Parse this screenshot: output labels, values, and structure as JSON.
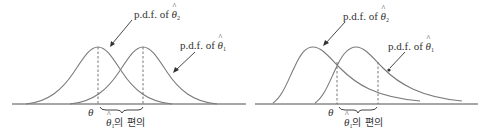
{
  "panels": [
    {
      "name": "symmetric",
      "labels": {
        "upper_pdf": {
          "prefix": "p.d.f. of ",
          "symbol": "θ",
          "subscript": "2"
        },
        "lower_pdf": {
          "prefix": "p.d.f. of ",
          "symbol": "θ",
          "subscript": "1"
        },
        "theta": "θ",
        "bias": {
          "symbol": "θ",
          "subscript": "1",
          "suffix": "의 편의"
        }
      }
    },
    {
      "name": "skewed",
      "labels": {
        "upper_pdf": {
          "prefix": "p.d.f. of ",
          "symbol": "θ",
          "subscript": "2"
        },
        "lower_pdf": {
          "prefix": "p.d.f. of ",
          "symbol": "θ",
          "subscript": "1"
        },
        "theta": "θ",
        "bias": {
          "symbol": "θ",
          "subscript": "1",
          "suffix": "의 편의"
        }
      }
    }
  ],
  "colors": {
    "curve": "#7a7a7a",
    "axis": "#8a8a8a",
    "text": "#333333"
  }
}
